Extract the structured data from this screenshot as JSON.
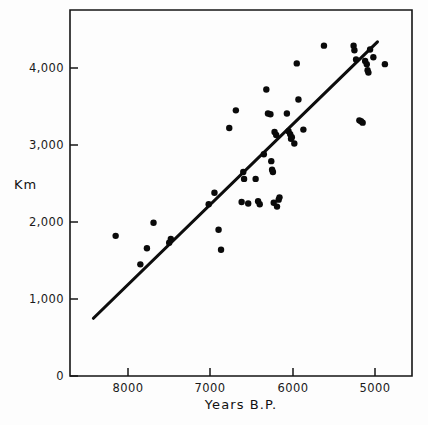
{
  "figure": {
    "background_color": "#fdfdfd",
    "ink_color": "#0d0d0d"
  },
  "labels": {
    "ylabel": "Km",
    "xlabel": "Years B.P.",
    "y_ticks": [
      "0",
      "1,000",
      "2,000",
      "3,000",
      "4,000"
    ],
    "x_ticks": [
      "8000",
      "7000",
      "6000",
      "5000"
    ]
  },
  "chart_data": {
    "type": "scatter",
    "title": "",
    "xlabel": "Years B.P.",
    "ylabel": "Km",
    "xlim": [
      8700,
      4700
    ],
    "ylim": [
      0,
      4700
    ],
    "x_reversed": true,
    "grid": false,
    "legend": null,
    "x_tick_values": [
      8000,
      7000,
      6000,
      5000
    ],
    "y_tick_values": [
      0,
      1000,
      2000,
      3000,
      4000
    ],
    "series": [
      {
        "name": "Sites",
        "marker": "filled-circle",
        "color": "#0a0a0a",
        "points": [
          [
            8150,
            1820
          ],
          [
            7850,
            1450
          ],
          [
            7770,
            1660
          ],
          [
            7690,
            1990
          ],
          [
            7480,
            1780
          ],
          [
            7500,
            1730
          ],
          [
            7020,
            2230
          ],
          [
            6950,
            2380
          ],
          [
            6900,
            1900
          ],
          [
            6870,
            1640
          ],
          [
            6770,
            3220
          ],
          [
            6690,
            3450
          ],
          [
            6620,
            2260
          ],
          [
            6600,
            2650
          ],
          [
            6590,
            2560
          ],
          [
            6540,
            2240
          ],
          [
            6450,
            2560
          ],
          [
            6420,
            2270
          ],
          [
            6400,
            2230
          ],
          [
            6350,
            2880
          ],
          [
            6320,
            3720
          ],
          [
            6300,
            3410
          ],
          [
            6270,
            3400
          ],
          [
            6260,
            2790
          ],
          [
            6250,
            2680
          ],
          [
            6240,
            2650
          ],
          [
            6230,
            2250
          ],
          [
            6220,
            3170
          ],
          [
            6200,
            3130
          ],
          [
            6190,
            2200
          ],
          [
            6170,
            2290
          ],
          [
            6160,
            2320
          ],
          [
            6070,
            3410
          ],
          [
            6050,
            3180
          ],
          [
            6030,
            3140
          ],
          [
            6020,
            3080
          ],
          [
            6010,
            3100
          ],
          [
            5980,
            3020
          ],
          [
            5950,
            4060
          ],
          [
            5930,
            3590
          ],
          [
            5870,
            3200
          ],
          [
            5620,
            4290
          ],
          [
            5260,
            4290
          ],
          [
            5250,
            4230
          ],
          [
            5230,
            4110
          ],
          [
            5190,
            3320
          ],
          [
            5170,
            3310
          ],
          [
            5150,
            3290
          ],
          [
            5120,
            4090
          ],
          [
            5100,
            4050
          ],
          [
            5090,
            3970
          ],
          [
            5080,
            3940
          ],
          [
            5060,
            4240
          ],
          [
            5020,
            4140
          ],
          [
            4880,
            4050
          ]
        ]
      }
    ],
    "fit_line": {
      "type": "linear-regression",
      "x_start": 8420,
      "y_start": 750,
      "x_end": 4970,
      "y_end": 4340
    }
  }
}
